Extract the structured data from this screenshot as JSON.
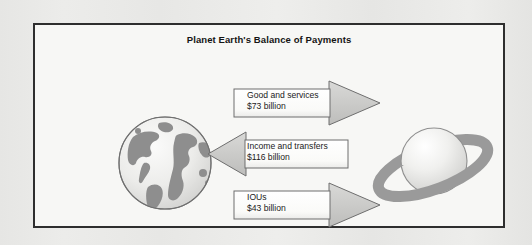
{
  "figure": {
    "title": "Planet Earth's Balance of Payments",
    "border_color": "#2e2e2e",
    "background_color": "#f7f7f5",
    "page_background_color": "#e8e8e6"
  },
  "illustrations": {
    "earth": {
      "name": "earth-globe",
      "ocean_color": "#e9e9e7",
      "land_color": "#8c8c8c",
      "outline_color": "#6f6f6f"
    },
    "planet": {
      "name": "ringed-planet",
      "sphere_color": "#eeeeec",
      "ring_color": "#9a9a9a",
      "outline_color": "#8a8a8a"
    }
  },
  "flows": [
    {
      "id": "goods-and-services",
      "direction": "right",
      "from": "earth",
      "to": "planet",
      "line1": "Good and services",
      "line2": "$73 billion",
      "amount": 73,
      "currency": "$",
      "unit": "billion",
      "body_color": "#fcfcfa",
      "head_color": "#c9c9c7",
      "outline_color": "#6e6e6e"
    },
    {
      "id": "income-and-transfers",
      "direction": "left",
      "from": "planet",
      "to": "earth",
      "line1": "Income and transfers",
      "line2": "$116 billion",
      "amount": 116,
      "currency": "$",
      "unit": "billion",
      "body_color": "#fcfcfa",
      "head_color": "#c9c9c7",
      "outline_color": "#6e6e6e"
    },
    {
      "id": "ious",
      "direction": "right",
      "from": "earth",
      "to": "planet",
      "line1": "IOUs",
      "line2": "$43 billion",
      "amount": 43,
      "currency": "$",
      "unit": "billion",
      "body_color": "#fcfcfa",
      "head_color": "#c9c9c7",
      "outline_color": "#6e6e6e"
    }
  ]
}
